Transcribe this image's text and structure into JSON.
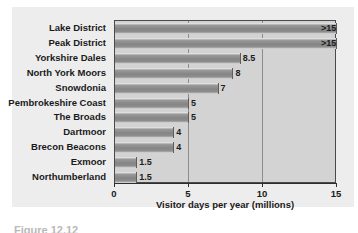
{
  "chart_data": {
    "type": "bar",
    "orientation": "horizontal",
    "title": "",
    "xlabel": "Visitor days per year (millions)",
    "ylabel": "",
    "xlim": [
      0,
      15
    ],
    "xticks": [
      "0",
      "5",
      "10",
      "15"
    ],
    "xtick_values": [
      0,
      5,
      10,
      15
    ],
    "gridlines": [
      5,
      10
    ],
    "grid": true,
    "legend": "none",
    "categories": [
      "Lake District",
      "Peak District",
      "Yorkshire Dales",
      "North York Moors",
      "Snowdonia",
      "Pembrokeshire Coast",
      "The Broads",
      "Dartmoor",
      "Brecon Beacons",
      "Exmoor",
      "Northumberland"
    ],
    "values": [
      15,
      15,
      8.5,
      8,
      7,
      5,
      5,
      4,
      4,
      1.5,
      1.5
    ],
    "value_labels": [
      ">15",
      ">15",
      "8.5",
      "8",
      "7",
      "5",
      "5",
      "4",
      "4",
      "1.5",
      "1.5"
    ]
  },
  "caption": {
    "text": "Figure 12.12"
  },
  "colors": {
    "page_background": "#ffffff",
    "figure_panel": "#ededed",
    "plot_background": "#d3d3d3",
    "plot_border": "#4a4a4a",
    "bar_fill": "#8a8a8a",
    "gridline": "#8d8d8d",
    "text": "#1a1a1a"
  }
}
